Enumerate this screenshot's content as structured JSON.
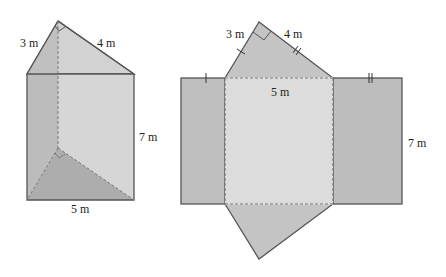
{
  "prism": {
    "labels": {
      "hyp_leg_short": "3 m",
      "hyp_leg_long": "4 m",
      "height": "7 m",
      "base": "5 m"
    }
  },
  "net": {
    "labels": {
      "leg_short": "3 m",
      "leg_long": "4 m",
      "center_width": "5 m",
      "height": "7 m"
    }
  },
  "colors": {
    "outline": "#555555",
    "face_dark": "#bcbcbc",
    "face_mid": "#c6c6c6",
    "face_light": "#d7d7d7",
    "face_lighter": "#dedede",
    "dashed": "#777777"
  }
}
